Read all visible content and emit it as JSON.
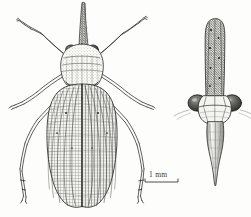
{
  "figure": {
    "title": "Insect scientific illustration plate",
    "background_color": "#fdfdfc",
    "ink_color": "#2b2b29",
    "width_px": 251,
    "height_px": 217,
    "panels": [
      {
        "id": "dorsal-view",
        "name": "dorsal habitus view",
        "description": "Whole insect seen from above: elongate upward head process (horn), dark compound eyes, pronotum, pair of long tegmina with dense longitudinal and cross veins, three pairs of legs",
        "position": "left"
      },
      {
        "id": "frontal-head-view",
        "name": "frontal head view",
        "description": "Head seen from the front: long median process, two large lateral compound eyes, tapering pointed rostrum below",
        "position": "right"
      }
    ]
  },
  "scale_bar": {
    "label": "1 mm",
    "length_px": 33,
    "tick_height_px": 4,
    "color": "#3a3a38"
  },
  "annotations": {
    "eye_fill": "#4a4a47",
    "wing_shade": "#8d8d88",
    "line_weight": 0.7
  }
}
